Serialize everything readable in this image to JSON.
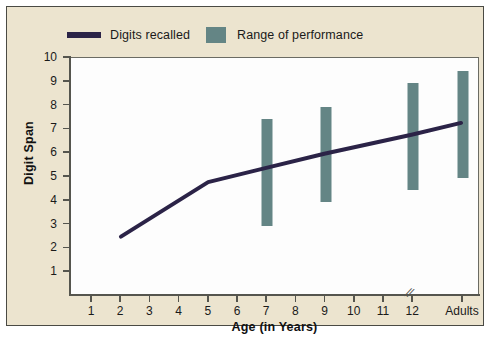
{
  "legend": {
    "entries": [
      {
        "label": "Digits recalled",
        "type": "line",
        "color": "#2b2347"
      },
      {
        "label": "Range of performance",
        "type": "bar",
        "color": "#648585"
      }
    ]
  },
  "axes": {
    "ylabel": "Digit Span",
    "xlabel": "Age (in Years)",
    "yticks": [
      1,
      2,
      3,
      4,
      5,
      6,
      7,
      8,
      9,
      10
    ],
    "xticks": [
      "1",
      "2",
      "3",
      "4",
      "5",
      "6",
      "7",
      "8",
      "9",
      "10",
      "11",
      "12",
      "Adults"
    ],
    "axis_break_glyph": "//"
  },
  "chart_data": {
    "type": "line",
    "title": "",
    "xlabel": "Age (in Years)",
    "ylabel": "Digit Span",
    "xlim": [
      0,
      13
    ],
    "ylim": [
      0,
      10
    ],
    "grid": false,
    "legend_position": "top-left",
    "x_categories": [
      "1",
      "2",
      "3",
      "4",
      "5",
      "6",
      "7",
      "8",
      "9",
      "10",
      "11",
      "12",
      "Adults"
    ],
    "axis_break_after": "12",
    "series": [
      {
        "name": "Digits recalled",
        "type": "line",
        "color": "#2b2347",
        "x": [
          "2",
          "5",
          "7",
          "9",
          "12",
          "Adults"
        ],
        "values": [
          2.5,
          4.8,
          5.4,
          6.0,
          6.8,
          7.3
        ]
      },
      {
        "name": "Range of performance",
        "type": "range-bar",
        "color": "#648585",
        "x": [
          "7",
          "9",
          "12",
          "Adults"
        ],
        "low": [
          3.0,
          4.0,
          4.5,
          5.0
        ],
        "high": [
          7.5,
          8.0,
          9.0,
          9.5
        ]
      }
    ]
  },
  "colors": {
    "panel_background": "#ece4cf",
    "plot_background": "#fdfdfd",
    "line": "#2b2347",
    "bar": "#648585",
    "axis": "#55554e",
    "frame": "#4a4a44"
  }
}
